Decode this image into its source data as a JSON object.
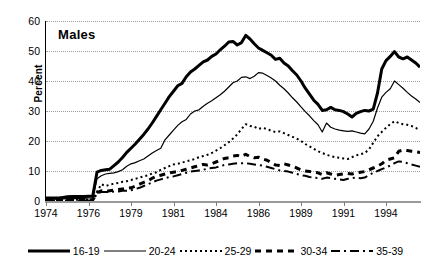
{
  "chart_data": {
    "type": "line",
    "title": "Males",
    "xlabel": "",
    "ylabel": "Percent",
    "ylim": [
      0,
      60
    ],
    "yticks": [
      0,
      10,
      20,
      30,
      40,
      50,
      60
    ],
    "xticklabels": [
      "1974",
      "1976",
      "1979",
      "1981",
      "1984",
      "1986",
      "1989",
      "1991",
      "1994"
    ],
    "xtick_positions": [
      0,
      10,
      20,
      30,
      40,
      50,
      60,
      70,
      80
    ],
    "x_unit": "quarter",
    "x_start_label": "1974",
    "x_end_label": "1996",
    "n_points": 89,
    "grid": true,
    "grid_style": "dotted",
    "legend_position": "bottom",
    "color": "#000000",
    "series": [
      {
        "name": "16-19",
        "style": "thick-solid",
        "linewidth": 3.0,
        "dash": "none",
        "values": [
          1.0,
          1.0,
          1.0,
          1.0,
          1.2,
          1.4,
          1.5,
          1.5,
          1.5,
          1.5,
          1.6,
          1.7,
          9.6,
          10.2,
          10.4,
          10.6,
          11.8,
          13.0,
          14.5,
          16.2,
          17.6,
          19.0,
          20.6,
          22.2,
          24.0,
          26.0,
          28.2,
          30.4,
          32.6,
          34.8,
          36.6,
          38.4,
          39.2,
          41.4,
          43.0,
          44.0,
          45.2,
          46.4,
          47.0,
          48.2,
          49.0,
          50.4,
          51.6,
          53.0,
          53.2,
          52.0,
          52.8,
          55.2,
          54.0,
          52.4,
          51.0,
          50.2,
          49.4,
          48.6,
          47.2,
          47.6,
          46.0,
          45.0,
          43.4,
          42.0,
          40.0,
          37.6,
          35.6,
          33.6,
          32.2,
          30.2,
          30.4,
          31.2,
          30.4,
          30.2,
          29.8,
          29.0,
          28.0,
          29.2,
          29.8,
          30.2,
          30.0,
          30.6,
          36.0,
          44.0,
          46.8,
          48.2,
          49.8,
          48.0,
          47.4,
          48.0,
          47.0,
          46.0,
          44.6
        ]
      },
      {
        "name": "20-24",
        "style": "thin-solid",
        "linewidth": 1.2,
        "dash": "none",
        "values": [
          0.6,
          0.6,
          0.6,
          0.6,
          0.7,
          0.8,
          0.8,
          0.8,
          0.9,
          0.9,
          1.0,
          1.0,
          7.4,
          8.4,
          9.0,
          9.2,
          9.4,
          9.8,
          10.4,
          11.6,
          12.4,
          12.8,
          13.4,
          14.0,
          15.0,
          16.0,
          16.8,
          17.6,
          20.4,
          22.0,
          23.6,
          25.2,
          26.4,
          27.2,
          29.0,
          30.0,
          30.4,
          31.6,
          32.6,
          33.4,
          34.4,
          35.4,
          36.6,
          38.0,
          39.4,
          40.0,
          41.2,
          41.4,
          40.8,
          41.6,
          42.8,
          42.6,
          41.8,
          41.0,
          40.0,
          38.6,
          37.4,
          36.0,
          34.4,
          33.0,
          31.4,
          29.8,
          28.4,
          26.8,
          25.4,
          23.0,
          26.0,
          24.6,
          24.0,
          23.6,
          23.4,
          23.2,
          23.4,
          23.0,
          22.6,
          22.4,
          24.0,
          26.6,
          31.0,
          34.6,
          36.2,
          37.4,
          40.0,
          38.8,
          37.6,
          36.2,
          35.0,
          34.0,
          32.8
        ]
      },
      {
        "name": "25-29",
        "style": "dotted",
        "linewidth": 2.0,
        "dash": "2,3",
        "values": [
          0.3,
          0.3,
          0.3,
          0.3,
          0.3,
          0.4,
          0.4,
          0.4,
          0.4,
          0.4,
          0.5,
          0.5,
          3.0,
          5.6,
          5.0,
          5.4,
          5.8,
          6.0,
          6.4,
          6.6,
          7.0,
          7.4,
          7.8,
          8.2,
          8.6,
          9.2,
          9.6,
          10.4,
          11.0,
          11.6,
          12.2,
          12.4,
          12.8,
          13.2,
          13.6,
          14.0,
          14.6,
          15.0,
          15.4,
          16.0,
          16.8,
          17.6,
          18.6,
          19.6,
          20.8,
          22.2,
          24.0,
          25.6,
          25.0,
          24.8,
          24.0,
          24.4,
          24.0,
          23.4,
          23.0,
          23.2,
          22.6,
          22.0,
          21.4,
          20.8,
          20.0,
          19.0,
          18.2,
          17.4,
          16.6,
          16.0,
          15.4,
          15.0,
          14.6,
          14.4,
          14.2,
          14.0,
          14.6,
          15.2,
          15.6,
          16.0,
          17.2,
          19.4,
          21.6,
          23.0,
          24.4,
          25.6,
          26.6,
          26.0,
          25.6,
          25.4,
          25.0,
          24.4,
          23.6
        ]
      },
      {
        "name": "30-34",
        "style": "dashed",
        "linewidth": 3.0,
        "dash": "6,5",
        "values": [
          0.2,
          0.2,
          0.2,
          0.2,
          0.2,
          0.2,
          0.3,
          0.3,
          0.3,
          0.3,
          0.3,
          0.3,
          2.8,
          3.4,
          3.2,
          3.4,
          3.6,
          3.8,
          4.0,
          4.2,
          4.4,
          5.0,
          5.6,
          6.2,
          6.8,
          7.6,
          8.2,
          8.6,
          9.0,
          9.4,
          9.6,
          9.8,
          10.2,
          10.6,
          11.0,
          11.4,
          11.8,
          12.2,
          12.0,
          12.4,
          13.0,
          13.6,
          14.2,
          14.4,
          15.0,
          15.2,
          14.8,
          15.6,
          14.8,
          14.4,
          14.6,
          14.0,
          13.6,
          12.8,
          12.0,
          11.8,
          12.4,
          12.0,
          11.6,
          11.0,
          10.4,
          10.0,
          9.8,
          9.6,
          9.4,
          8.8,
          9.4,
          9.0,
          8.6,
          8.8,
          9.0,
          9.2,
          9.0,
          9.4,
          9.6,
          9.8,
          10.4,
          11.0,
          11.6,
          12.4,
          13.6,
          14.0,
          14.4,
          16.6,
          17.0,
          16.8,
          16.6,
          16.4,
          16.2
        ]
      },
      {
        "name": "35-39",
        "style": "dash-dot",
        "linewidth": 2.0,
        "dash": "9,4,2,4",
        "values": [
          0.1,
          0.1,
          0.1,
          0.1,
          0.1,
          0.1,
          0.2,
          0.2,
          0.2,
          0.2,
          0.2,
          0.2,
          2.4,
          3.0,
          3.0,
          3.0,
          3.2,
          3.2,
          3.4,
          3.4,
          3.6,
          4.0,
          4.4,
          5.0,
          5.6,
          6.2,
          6.8,
          7.2,
          7.6,
          8.0,
          8.2,
          8.6,
          9.0,
          9.4,
          9.8,
          10.0,
          10.2,
          10.4,
          10.8,
          11.0,
          11.2,
          11.6,
          12.0,
          12.2,
          12.4,
          12.6,
          12.6,
          12.6,
          12.4,
          12.2,
          12.0,
          11.8,
          11.4,
          11.0,
          10.6,
          10.2,
          10.0,
          9.8,
          9.4,
          9.0,
          8.6,
          8.4,
          8.0,
          7.8,
          7.6,
          7.4,
          7.8,
          7.6,
          7.4,
          7.2,
          7.0,
          7.4,
          7.6,
          7.8,
          7.6,
          7.8,
          8.6,
          9.4,
          10.0,
          10.6,
          11.2,
          11.8,
          12.6,
          13.2,
          13.0,
          12.6,
          12.2,
          11.8,
          11.4
        ]
      }
    ]
  },
  "legend": {
    "items": [
      {
        "label": "16-19"
      },
      {
        "label": "20-24"
      },
      {
        "label": "25-29"
      },
      {
        "label": "30-34"
      },
      {
        "label": "35-39"
      }
    ]
  }
}
